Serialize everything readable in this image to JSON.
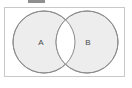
{
  "figure": {
    "kind": "venn-diagram",
    "frame": {
      "border_color": "#c9c9c9",
      "background_color": "#ffffff"
    },
    "top_fragment": {
      "name": "cropped-element-fragment",
      "color": "#8f8f8f"
    },
    "circle_style": {
      "fill_color": "#ededed",
      "stroke_color": "#8c8c8c",
      "overlap_fill_color": "#ffffff"
    },
    "sets": [
      {
        "id": "set-a",
        "label": "A",
        "cx": 44,
        "cy": 42,
        "r": 31,
        "label_x": 41,
        "label_y": 43
      },
      {
        "id": "set-b",
        "label": "B",
        "cx": 87,
        "cy": 42,
        "r": 31,
        "label_x": 88,
        "label_y": 43
      }
    ]
  }
}
